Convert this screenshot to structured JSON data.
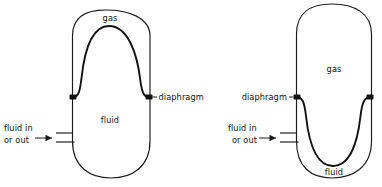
{
  "diagram": {
    "stroke_color": "#1a1a1a",
    "diaphragm_color": "#111111",
    "background_color": "#ffffff"
  },
  "left_vessel": {
    "name": "left-accumulator",
    "state": "fluid-filled",
    "labels": {
      "gas": "gas",
      "fluid": "fluid",
      "diaphragm": "diaphragm",
      "port_line1": "fluid in",
      "port_line2": "or out"
    }
  },
  "right_vessel": {
    "name": "right-accumulator",
    "state": "gas-expanded",
    "labels": {
      "gas": "gas",
      "fluid": "fluid",
      "diaphragm": "diaphragm",
      "port_line1": "fluid in",
      "port_line2": "or out"
    }
  }
}
